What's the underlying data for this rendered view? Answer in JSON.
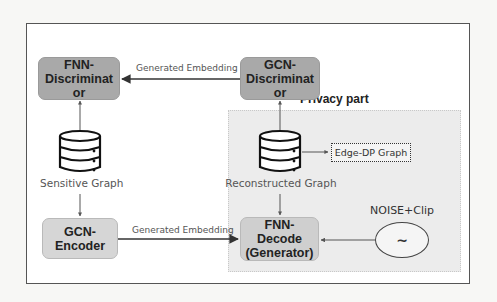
{
  "diagram": {
    "privacy_label": "Privacy part",
    "nodes": {
      "fnn_discriminator": {
        "label_line1": "FNN-",
        "label_line2": "Discriminat",
        "label_line3": "or"
      },
      "gcn_discriminator": {
        "label_line1": "GCN-",
        "label_line2": "Discriminat",
        "label_line3": "or"
      },
      "gcn_encoder": {
        "label_line1": "GCN-",
        "label_line2": "Encoder"
      },
      "fnn_decode": {
        "label_line1": "FNN-",
        "label_line2": "Decode",
        "label_line3": "(Generator)"
      },
      "sensitive_graph": {
        "label": "Sensitive Graph",
        "icon": "database-icon"
      },
      "reconstructed_graph": {
        "label": "Reconstructed Graph",
        "icon": "database-icon"
      },
      "edge_dp_graph": {
        "label": "Edge-DP Graph"
      },
      "noise": {
        "label": "NOISE+Clip",
        "symbol": "~"
      }
    },
    "edges": {
      "top": "Generated Embedding",
      "bottom": "Generated Embedding"
    },
    "colors": {
      "discriminator_fill": "#a9a9a9",
      "encoder_fill": "#d6d6d6",
      "privacy_region": "#ececec",
      "frame_border": "#555555"
    }
  }
}
